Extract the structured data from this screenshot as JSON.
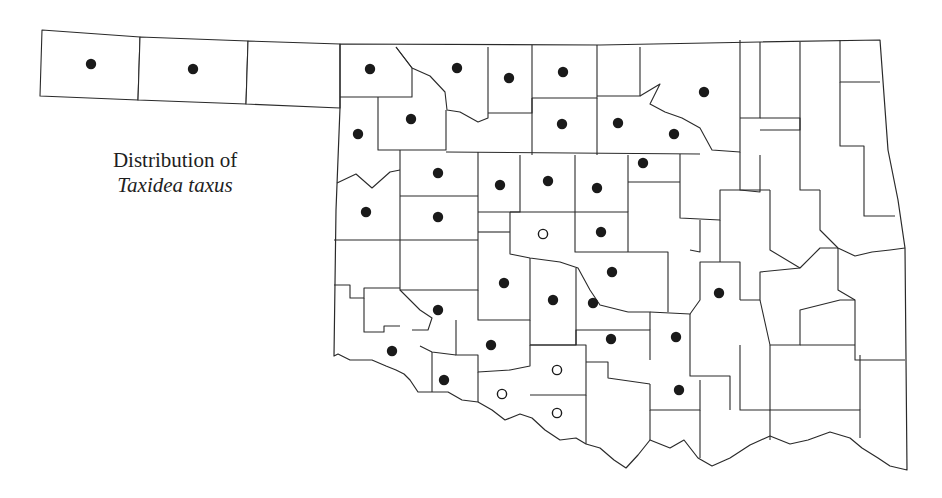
{
  "title": {
    "line1": "Distribution of",
    "line2": "Taxidea taxus"
  },
  "colors": {
    "line": "#2a2a2a",
    "marker_solid": "#1a1a1a",
    "background": "#ffffff"
  },
  "legend": {
    "solid_marker": "filled circle = record",
    "open_marker": "open circle = record"
  },
  "markers": {
    "solid": [
      [
        91,
        64
      ],
      [
        193,
        69
      ],
      [
        370,
        69
      ],
      [
        457,
        68
      ],
      [
        509,
        78
      ],
      [
        563,
        72
      ],
      [
        704,
        92
      ],
      [
        358,
        134
      ],
      [
        411,
        119
      ],
      [
        562,
        124
      ],
      [
        618,
        123
      ],
      [
        674,
        134
      ],
      [
        438,
        173
      ],
      [
        500,
        185
      ],
      [
        548,
        181
      ],
      [
        597,
        188
      ],
      [
        643,
        163
      ],
      [
        366,
        212
      ],
      [
        438,
        217
      ],
      [
        601,
        232
      ],
      [
        612,
        272
      ],
      [
        504,
        283
      ],
      [
        553,
        300
      ],
      [
        593,
        303
      ],
      [
        438,
        310
      ],
      [
        719,
        293
      ],
      [
        392,
        351
      ],
      [
        491,
        345
      ],
      [
        611,
        339
      ],
      [
        676,
        337
      ],
      [
        444,
        380
      ],
      [
        679,
        390
      ]
    ],
    "open": [
      [
        543,
        234
      ],
      [
        557,
        370
      ],
      [
        502,
        394
      ],
      [
        557,
        413
      ]
    ]
  }
}
